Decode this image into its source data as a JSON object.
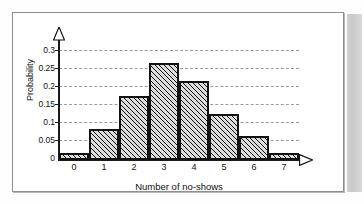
{
  "figure": {
    "frame_border_color": "#8e8e8e",
    "background_color": "#ffffff",
    "edge_strip_color": "#cfcfcf"
  },
  "axis_arrows": {
    "y_arrow_name": "y-axis-arrowhead",
    "x_arrow_name": "x-axis-arrowhead"
  },
  "chart_data": {
    "type": "bar",
    "title": "",
    "subtitle": "",
    "xlabel": "Number of no-shows",
    "ylabel": "Probability",
    "categories": [
      "0",
      "1",
      "2",
      "3",
      "4",
      "5",
      "6",
      "7"
    ],
    "values": [
      0.02,
      0.085,
      0.175,
      0.265,
      0.215,
      0.125,
      0.065,
      0.02
    ],
    "ylim": [
      0,
      0.3
    ],
    "ytick_labels": [
      "0",
      "0.05",
      "0.1",
      "0.15",
      "0.2",
      "0.25",
      "0.3"
    ],
    "ytick_values": [
      0,
      0.05,
      0.1,
      0.15,
      0.2,
      0.25,
      0.3
    ],
    "grid": true,
    "grid_style": "dashed",
    "grid_color": "#9a9a9a",
    "legend": null,
    "legend_position": "none",
    "bar_edge_color": "#111111",
    "bar_fill_color": "#dcdcdc",
    "bar_fill_pattern": "diagonal-hatch",
    "annotations": []
  }
}
